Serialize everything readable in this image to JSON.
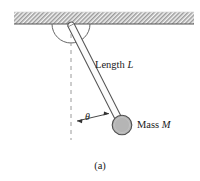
{
  "figure": {
    "caption": "(a)",
    "labels": {
      "length": "Length",
      "length_symbol": "L",
      "mass": "Mass",
      "mass_symbol": "M",
      "angle_symbol": "θ"
    },
    "parts": {
      "ceiling": "hatched-ceiling",
      "pivot": "pivot-point",
      "pivot_arc": "pivot-arc",
      "rod": "pendulum-rod",
      "bob": "pendulum-mass-ball",
      "reference_line": "vertical-dashed-reference-line",
      "angle_arrow": "angle-double-arrow"
    },
    "colors": {
      "ink": "#1a1a1a",
      "outline": "#555555",
      "ball_fill": "#b3b3b3",
      "ball_stroke": "#4d4d4d",
      "hatch": "#8c8c8c",
      "ceiling_fill": "#f2f2f2",
      "dashed": "#999999"
    },
    "geometry": {
      "ceiling": {
        "x": 14,
        "y": 12,
        "width": 180,
        "height": 12
      },
      "pivot": {
        "x": 71,
        "y": 28
      },
      "bob": {
        "cx": 122,
        "cy": 125,
        "r": 10
      },
      "reference_line": {
        "x": 71,
        "y_top": 34,
        "y_bottom": 140
      },
      "angle_arrow": {
        "x1": 76,
        "y1": 121,
        "x2": 110,
        "y2": 113
      }
    }
  }
}
